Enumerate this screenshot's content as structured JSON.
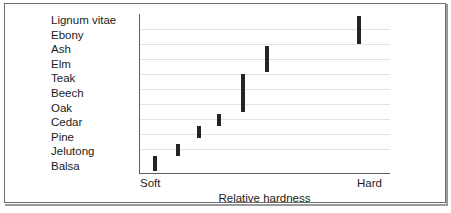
{
  "chart_data": {
    "type": "scatter",
    "title": "",
    "subtitle": "",
    "xlabel": "Relative hardness",
    "ylabel": "",
    "grid": true,
    "legend": null,
    "orientation": "horizontal",
    "x_axis_ticks": [
      "Soft",
      "Hard"
    ],
    "x_axis_tick_labels": {
      "left": "Soft",
      "right": "Hard"
    },
    "xlim": [
      0,
      100
    ],
    "categories": [
      "Lignum vitae",
      "Ebony",
      "Ash",
      "Elm",
      "Teak",
      "Beech",
      "Oak",
      "Cedar",
      "Pine",
      "Jelutong",
      "Balsa"
    ],
    "note": "Each dark vertical bar marks the hardness band of one or more woods; bars ascend from Balsa (softest, lower-left) to Lignum vitae (hardest, upper-right).",
    "markers": [
      {
        "label": "Lignum vitae",
        "x_value": 87,
        "x_px": 352,
        "y_top_px": 12,
        "y_bottom_px": 40,
        "rows_spanned": [
          "Lignum vitae",
          "Ebony"
        ]
      },
      {
        "label": "Ash / Elm",
        "x_value": 50,
        "x_px": 260,
        "y_top_px": 42,
        "y_bottom_px": 68,
        "rows_spanned": [
          "Ash",
          "Elm"
        ]
      },
      {
        "label": "Teak / Beech / Oak",
        "x_value": 41,
        "x_px": 236,
        "y_top_px": 70,
        "y_bottom_px": 108,
        "rows_spanned": [
          "Teak",
          "Beech",
          "Oak"
        ]
      },
      {
        "label": "Cedar",
        "x_value": 31,
        "x_px": 212,
        "y_top_px": 110,
        "y_bottom_px": 122,
        "rows_spanned": [
          "Cedar"
        ]
      },
      {
        "label": "Pine",
        "x_value": 23,
        "x_px": 192,
        "y_top_px": 122,
        "y_bottom_px": 134,
        "rows_spanned": [
          "Pine"
        ]
      },
      {
        "label": "Jelutong",
        "x_value": 15,
        "x_px": 171,
        "y_top_px": 140,
        "y_bottom_px": 152,
        "rows_spanned": [
          "Jelutong"
        ]
      },
      {
        "label": "Balsa",
        "x_value": 6,
        "x_px": 148,
        "y_top_px": 152,
        "y_bottom_px": 167,
        "rows_spanned": [
          "Balsa"
        ]
      }
    ],
    "gridlines_y_px": [
      25,
      40,
      55,
      70,
      85,
      100,
      115,
      130,
      145
    ],
    "colors": {
      "marker": "#242424",
      "grid": "#e2e2e2",
      "axis": "#5d5d5d",
      "text": "#1b1b1b",
      "background": "#ffffff",
      "frame": "#6e6e6e"
    }
  }
}
